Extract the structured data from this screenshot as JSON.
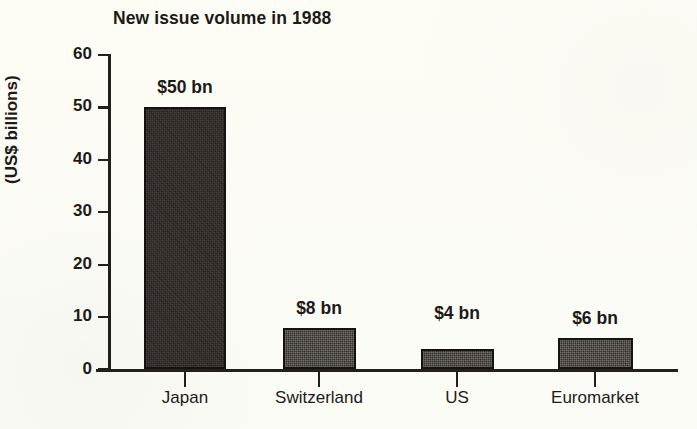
{
  "chart_data": {
    "type": "bar",
    "title": "New issue volume in 1988",
    "xlabel": "",
    "ylabel": "(US$ billions)",
    "categories": [
      "Japan",
      "Switzerland",
      "US",
      "Euromarket"
    ],
    "values": [
      50,
      8,
      4,
      6
    ],
    "value_labels": [
      "$50 bn",
      "$8 bn",
      "$4 bn",
      "$6 bn"
    ],
    "ylim": [
      0,
      60
    ],
    "y_ticks": [
      0,
      10,
      20,
      30,
      40,
      50,
      60
    ],
    "y_tick_labels": [
      "0",
      "10",
      "20",
      "30",
      "40",
      "50",
      "60"
    ],
    "grid": false,
    "legend": false,
    "legend_position": "none",
    "series": [
      {
        "name": "New issue volume",
        "values": [
          50,
          8,
          4,
          6
        ]
      }
    ],
    "units": "US$ billions",
    "colors": {
      "bar_fill_tall": "#2e2825",
      "bar_fill_short": "#3a3530",
      "bar_outline": "#151311",
      "axis": "#221f1c",
      "text": "#1d1a17",
      "background": "#fdfdf8"
    }
  }
}
